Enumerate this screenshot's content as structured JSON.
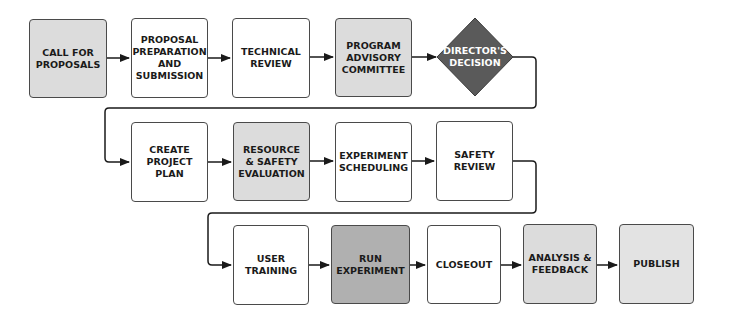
{
  "diagram": {
    "type": "flowchart",
    "rows": [
      {
        "steps": [
          {
            "id": "call",
            "label": "CALL FOR\nPROPOSALS",
            "shape": "rect",
            "fill": "#dcdcdc"
          },
          {
            "id": "prep",
            "label": "PROPOSAL\nPREPARATION\nAND\nSUBMISSION",
            "shape": "rect",
            "fill": "#ffffff"
          },
          {
            "id": "tech",
            "label": "TECHNICAL\nREVIEW",
            "shape": "rect",
            "fill": "#ffffff"
          },
          {
            "id": "pac",
            "label": "PROGRAM\nADVISORY\nCOMMITTEE",
            "shape": "rect",
            "fill": "#dcdcdc"
          },
          {
            "id": "director",
            "label": "DIRECTOR'S\nDECISION",
            "shape": "diamond",
            "fill": "#5a5a5a"
          }
        ]
      },
      {
        "steps": [
          {
            "id": "plan",
            "label": "CREATE\nPROJECT\nPLAN",
            "shape": "rect",
            "fill": "#ffffff"
          },
          {
            "id": "resource",
            "label": "RESOURCE\n& SAFETY\nEVALUATION",
            "shape": "rect",
            "fill": "#dcdcdc"
          },
          {
            "id": "sched",
            "label": "EXPERIMENT\nSCHEDULING",
            "shape": "rect",
            "fill": "#ffffff"
          },
          {
            "id": "safety",
            "label": "SAFETY\nREVIEW",
            "shape": "rect",
            "fill": "#ffffff"
          }
        ]
      },
      {
        "steps": [
          {
            "id": "training",
            "label": "USER\nTRAINING",
            "shape": "rect",
            "fill": "#ffffff"
          },
          {
            "id": "run",
            "label": "RUN\nEXPERIMENT",
            "shape": "rect",
            "fill": "#b0b0b0"
          },
          {
            "id": "closeout",
            "label": "CLOSEOUT",
            "shape": "rect",
            "fill": "#ffffff"
          },
          {
            "id": "analysis",
            "label": "ANALYSIS &\nFEEDBACK",
            "shape": "rect",
            "fill": "#dcdcdc"
          },
          {
            "id": "publish",
            "label": "PUBLISH",
            "shape": "rect",
            "fill": "#e3e3e3"
          }
        ]
      }
    ]
  }
}
